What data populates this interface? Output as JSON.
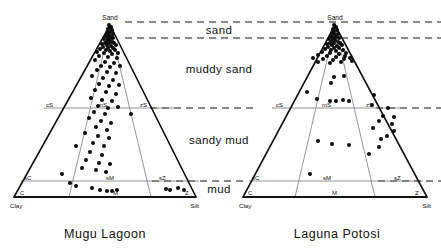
{
  "figure": {
    "type": "ternary-classification-diagram"
  },
  "zones": [
    {
      "id": "sand",
      "label": "sand"
    },
    {
      "id": "muddy_sand",
      "label": "muddy sand"
    },
    {
      "id": "sandy_mud",
      "label": "sandy mud"
    },
    {
      "id": "mud",
      "label": "mud"
    }
  ],
  "panels": [
    {
      "id": "mugu",
      "caption": "Mugu Lagoon",
      "apex_label": "Sand",
      "left_corner_label": "Clay",
      "right_corner_label": "Silt",
      "class_labels": [
        {
          "text": "cS",
          "tx": 46,
          "ty": 107
        },
        {
          "text": "mS",
          "tx": 98,
          "ty": 107
        },
        {
          "text": "zS",
          "tx": 140,
          "ty": 107
        },
        {
          "text": "sC",
          "tx": 24,
          "ty": 180
        },
        {
          "text": "sM",
          "tx": 106,
          "ty": 180
        },
        {
          "text": "sZ",
          "tx": 159,
          "ty": 180
        },
        {
          "text": "C",
          "tx": 20,
          "ty": 195
        },
        {
          "text": "M",
          "tx": 113,
          "ty": 195
        },
        {
          "text": "Z",
          "tx": 185,
          "ty": 195
        }
      ],
      "points": [
        [
          109,
          25
        ],
        [
          111,
          27
        ],
        [
          108,
          29
        ],
        [
          112,
          30
        ],
        [
          110,
          32
        ],
        [
          107,
          33
        ],
        [
          113,
          34
        ],
        [
          109,
          35
        ],
        [
          106,
          36
        ],
        [
          111,
          37
        ],
        [
          108,
          38
        ],
        [
          113,
          38
        ],
        [
          104,
          39
        ],
        [
          110,
          40
        ],
        [
          107,
          41
        ],
        [
          112,
          42
        ],
        [
          105,
          43
        ],
        [
          109,
          43
        ],
        [
          114,
          43
        ],
        [
          102,
          44
        ],
        [
          107,
          45
        ],
        [
          111,
          46
        ],
        [
          116,
          45
        ],
        [
          103,
          47
        ],
        [
          108,
          48
        ],
        [
          113,
          48
        ],
        [
          100,
          49
        ],
        [
          106,
          50
        ],
        [
          110,
          51
        ],
        [
          115,
          50
        ],
        [
          97,
          52
        ],
        [
          104,
          53
        ],
        [
          112,
          54
        ],
        [
          118,
          53
        ],
        [
          99,
          56
        ],
        [
          108,
          57
        ],
        [
          117,
          58
        ],
        [
          95,
          60
        ],
        [
          105,
          62
        ],
        [
          114,
          63
        ],
        [
          101,
          66
        ],
        [
          110,
          67
        ],
        [
          120,
          66
        ],
        [
          97,
          70
        ],
        [
          107,
          72
        ],
        [
          116,
          73
        ],
        [
          92,
          76
        ],
        [
          103,
          78
        ],
        [
          113,
          80
        ],
        [
          99,
          84
        ],
        [
          109,
          86
        ],
        [
          119,
          85
        ],
        [
          95,
          90
        ],
        [
          106,
          92
        ],
        [
          116,
          94
        ],
        [
          91,
          98
        ],
        [
          102,
          100
        ],
        [
          112,
          101
        ],
        [
          98,
          106
        ],
        [
          108,
          108
        ],
        [
          118,
          107
        ],
        [
          94,
          112
        ],
        [
          105,
          114
        ],
        [
          131,
          114
        ],
        [
          89,
          118
        ],
        [
          101,
          121
        ],
        [
          111,
          123
        ],
        [
          96,
          127
        ],
        [
          107,
          130
        ],
        [
          85,
          133
        ],
        [
          98,
          136
        ],
        [
          109,
          138
        ],
        [
          93,
          143
        ],
        [
          104,
          146
        ],
        [
          76,
          146
        ],
        [
          90,
          152
        ],
        [
          102,
          155
        ],
        [
          86,
          160
        ],
        [
          99,
          163
        ],
        [
          110,
          164
        ],
        [
          82,
          168
        ],
        [
          96,
          170
        ],
        [
          106,
          172
        ],
        [
          62,
          174
        ],
        [
          70,
          183
        ],
        [
          76,
          186
        ],
        [
          92,
          188
        ],
        [
          100,
          190
        ],
        [
          107,
          191
        ],
        [
          112,
          191
        ],
        [
          117,
          190
        ],
        [
          166,
          189
        ],
        [
          170,
          190
        ],
        [
          178,
          188
        ],
        [
          184,
          190
        ]
      ]
    },
    {
      "id": "potosi",
      "caption": "Laguna Potosi",
      "apex_label": "Sand",
      "left_corner_label": "Clay",
      "right_corner_label": "Silt",
      "class_labels": [
        {
          "text": "cS",
          "tx": 276,
          "ty": 107
        },
        {
          "text": "mS",
          "tx": 322,
          "ty": 107
        },
        {
          "text": "zS",
          "tx": 366,
          "ty": 107
        },
        {
          "text": "sC",
          "tx": 252,
          "ty": 180
        },
        {
          "text": "sM",
          "tx": 323,
          "ty": 180
        },
        {
          "text": "sZ",
          "tx": 394,
          "ty": 180
        },
        {
          "text": "C",
          "tx": 248,
          "ty": 195
        },
        {
          "text": "M",
          "tx": 332,
          "ty": 195
        },
        {
          "text": "Z",
          "tx": 415,
          "ty": 195
        }
      ],
      "points": [
        [
          334,
          25
        ],
        [
          336,
          27
        ],
        [
          333,
          29
        ],
        [
          337,
          30
        ],
        [
          334,
          32
        ],
        [
          332,
          33
        ],
        [
          338,
          34
        ],
        [
          335,
          35
        ],
        [
          331,
          36
        ],
        [
          336,
          37
        ],
        [
          333,
          38
        ],
        [
          339,
          38
        ],
        [
          329,
          39
        ],
        [
          335,
          40
        ],
        [
          332,
          41
        ],
        [
          338,
          42
        ],
        [
          330,
          43
        ],
        [
          334,
          43
        ],
        [
          340,
          43
        ],
        [
          327,
          44
        ],
        [
          332,
          45
        ],
        [
          337,
          46
        ],
        [
          342,
          45
        ],
        [
          328,
          47
        ],
        [
          334,
          48
        ],
        [
          339,
          48
        ],
        [
          325,
          49
        ],
        [
          331,
          50
        ],
        [
          336,
          51
        ],
        [
          343,
          50
        ],
        [
          322,
          52
        ],
        [
          330,
          53
        ],
        [
          339,
          54
        ],
        [
          346,
          53
        ],
        [
          318,
          55
        ],
        [
          327,
          56
        ],
        [
          336,
          57
        ],
        [
          345,
          56
        ],
        [
          313,
          58
        ],
        [
          323,
          59
        ],
        [
          333,
          60
        ],
        [
          344,
          59
        ],
        [
          350,
          58
        ],
        [
          318,
          62
        ],
        [
          330,
          63
        ],
        [
          341,
          62
        ],
        [
          352,
          61
        ],
        [
          334,
          77
        ],
        [
          344,
          76
        ],
        [
          331,
          83
        ],
        [
          307,
          92
        ],
        [
          317,
          99
        ],
        [
          330,
          101
        ],
        [
          336,
          101
        ],
        [
          343,
          100
        ],
        [
          349,
          101
        ],
        [
          374,
          95
        ],
        [
          372,
          105
        ],
        [
          388,
          108
        ],
        [
          383,
          116
        ],
        [
          394,
          117
        ],
        [
          379,
          121
        ],
        [
          392,
          124
        ],
        [
          394,
          131
        ],
        [
          373,
          128
        ],
        [
          387,
          136
        ],
        [
          381,
          139
        ],
        [
          318,
          141
        ],
        [
          332,
          144
        ],
        [
          349,
          145
        ],
        [
          379,
          147
        ],
        [
          369,
          154
        ],
        [
          310,
          174
        ]
      ]
    }
  ]
}
